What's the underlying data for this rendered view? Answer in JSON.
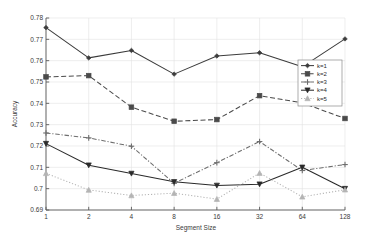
{
  "chart_data": {
    "type": "line",
    "title": "",
    "xlabel": "Segment Size",
    "ylabel": "Accuracy",
    "categories": [
      "1",
      "2",
      "4",
      "8",
      "16",
      "32",
      "64",
      "128"
    ],
    "x_tick_labels": [
      "1",
      "2",
      "4",
      "8",
      "16",
      "32",
      "64",
      "128"
    ],
    "y_tick_labels": [
      "0.69",
      "0.7",
      "0.71",
      "0.72",
      "0.73",
      "0.74",
      "0.75",
      "0.76",
      "0.77",
      "0.78"
    ],
    "y_tick_values": [
      0.69,
      0.7,
      0.71,
      0.72,
      0.73,
      0.74,
      0.75,
      0.76,
      0.77,
      0.78
    ],
    "ylim": [
      0.69,
      0.78
    ],
    "xlim_categorical": true,
    "grid": true,
    "legend_position": "right",
    "series": [
      {
        "name": "k=1",
        "values": [
          0.7755,
          0.7613,
          0.7648,
          0.7537,
          0.7622,
          0.7637,
          0.7571,
          0.7702
        ],
        "color": "#3c3c3c",
        "line_style": "solid",
        "marker": "diamond"
      },
      {
        "name": "k=2",
        "values": [
          0.7524,
          0.753,
          0.7382,
          0.7316,
          0.7324,
          0.7436,
          0.7402,
          0.7329
        ],
        "color": "#4a4a4a",
        "line_style": "dashed",
        "marker": "square"
      },
      {
        "name": "k=3",
        "values": [
          0.7261,
          0.7238,
          0.7199,
          0.7025,
          0.7122,
          0.7221,
          0.7085,
          0.7113
        ],
        "color": "#6e6e6e",
        "line_style": "dashdot",
        "marker": "plus"
      },
      {
        "name": "k=4",
        "values": [
          0.7211,
          0.711,
          0.7071,
          0.7032,
          0.7015,
          0.7021,
          0.71,
          0.7
        ],
        "color": "#2a2a2a",
        "line_style": "solid",
        "marker": "triangle-down"
      },
      {
        "name": "k=5",
        "values": [
          0.7072,
          0.6994,
          0.6968,
          0.6979,
          0.6951,
          0.7073,
          0.6962,
          0.6995
        ],
        "color": "#b4b4b4",
        "line_style": "dotted",
        "marker": "triangle-up"
      }
    ]
  },
  "legend": {
    "entries": [
      "k=1",
      "k=2",
      "k=3",
      "k=4",
      "k=5"
    ]
  },
  "colors": {
    "axis": "#5a5a5a",
    "grid": "#e3e3e3",
    "background": "#ffffff",
    "text": "#3a3a3a"
  },
  "plot_geometry": {
    "left": 46,
    "right": 345,
    "top": 18,
    "bottom": 210
  }
}
